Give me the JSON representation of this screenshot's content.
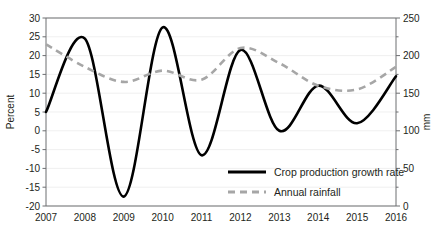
{
  "chart_data": {
    "type": "line",
    "title": "",
    "xlabel": "",
    "categories": [
      "2007",
      "2008",
      "2009",
      "2010",
      "2011",
      "2012",
      "2013",
      "2014",
      "2015",
      "2016"
    ],
    "x": [
      2007,
      2008,
      2009,
      2010,
      2011,
      2012,
      2013,
      2014,
      2015,
      2016
    ],
    "grid": true,
    "legend_position": "bottom-right",
    "axes": {
      "left": {
        "label": "Percent",
        "ylim": [
          -20,
          30
        ],
        "ticks": [
          -20,
          -15,
          -10,
          -5,
          0,
          5,
          10,
          15,
          20,
          25,
          30
        ],
        "tick_labels": [
          "-20",
          "-15",
          "-10",
          "-5",
          "0",
          "5",
          "10",
          "15",
          "20",
          "25",
          "30"
        ]
      },
      "right": {
        "label": "mm",
        "ylim": [
          0,
          250
        ],
        "ticks": [
          0,
          50,
          100,
          150,
          200,
          250
        ],
        "tick_labels": [
          "0",
          "50",
          "100",
          "150",
          "200",
          "250"
        ],
        "minor_ticks": [
          25,
          75,
          125,
          175,
          225
        ]
      }
    },
    "series": [
      {
        "name": "Crop production growth rate",
        "axis": "left",
        "style": "solid",
        "color": "#000000",
        "unit": "percent",
        "values": [
          5,
          24.5,
          -17.5,
          27.5,
          -6.5,
          21.5,
          0,
          12,
          2,
          14.5
        ]
      },
      {
        "name": "Annual rainfall",
        "axis": "right",
        "style": "dashed",
        "color": "#a6a6a6",
        "unit": "mm",
        "values": [
          215,
          185,
          165,
          180,
          168,
          210,
          190,
          160,
          155,
          185
        ]
      }
    ]
  },
  "legend": {
    "items": [
      {
        "label": "Crop production growth rate"
      },
      {
        "label": "Annual rainfall"
      }
    ]
  },
  "colors": {
    "solid_series": "#000000",
    "dashed_series": "#a6a6a6",
    "axis": "#6d6e71",
    "grid": "#e9e9e9",
    "text": "#231f20",
    "background": "#ffffff"
  }
}
